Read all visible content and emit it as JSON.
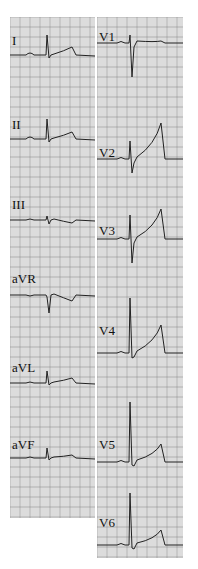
{
  "ecg": {
    "grid": {
      "minor_color": "#bdbdbd",
      "major_color": "#8f8f8f",
      "bg": "#eeeeee",
      "trace_color": "#222222"
    },
    "left_panel": {
      "x": 10,
      "y": 17,
      "w": 85,
      "h": 501,
      "leads": [
        {
          "label": "I",
          "label_x": 2,
          "label_y": 28,
          "baseline": 38,
          "beat_x": 36,
          "p": 2,
          "r": -20,
          "q": 0,
          "s": 3,
          "t": -8,
          "t_x": 62
        },
        {
          "label": "II",
          "label_x": 2,
          "label_y": 112,
          "baseline": 122,
          "beat_x": 36,
          "p": 2,
          "r": -20,
          "q": 0,
          "s": 3,
          "t": -7,
          "t_x": 62
        },
        {
          "label": "III",
          "label_x": 2,
          "label_y": 192,
          "baseline": 203,
          "beat_x": 36,
          "p": 1,
          "r": -4,
          "q": 0,
          "s": 4,
          "t": 3,
          "t_x": 62
        },
        {
          "label": "aVR",
          "label_x": 2,
          "label_y": 266,
          "baseline": 278,
          "beat_x": 36,
          "p": -1,
          "r": 2,
          "q": 0,
          "s": 18,
          "t": 6,
          "t_x": 62
        },
        {
          "label": "aVL",
          "label_x": 2,
          "label_y": 355,
          "baseline": 366,
          "beat_x": 36,
          "p": 1,
          "r": -12,
          "q": 0,
          "s": 2,
          "t": -5,
          "t_x": 62
        },
        {
          "label": "aVF",
          "label_x": 2,
          "label_y": 432,
          "baseline": 441,
          "beat_x": 36,
          "p": 1,
          "r": -10,
          "q": 0,
          "s": 2,
          "t": -3,
          "t_x": 62
        }
      ]
    },
    "right_panel": {
      "x": 97,
      "y": 17,
      "w": 86,
      "h": 541,
      "leads": [
        {
          "label": "V1",
          "label_x": 2,
          "label_y": 24,
          "baseline": 26,
          "beat_x": 3,
          "p": 1,
          "r": -8,
          "q": 0,
          "s": 34,
          "t": -2,
          "t_x": 30
        },
        {
          "label": "V2",
          "label_x": 2,
          "label_y": 140,
          "baseline": 142,
          "beat_x": 3,
          "p": 1,
          "r": -18,
          "q": 0,
          "s": 14,
          "t": -36,
          "t_x": 30
        },
        {
          "label": "V3",
          "label_x": 2,
          "label_y": 218,
          "baseline": 222,
          "beat_x": 3,
          "p": 1,
          "r": -24,
          "q": 0,
          "s": 24,
          "t": -30,
          "t_x": 30
        },
        {
          "label": "V4",
          "label_x": 2,
          "label_y": 318,
          "baseline": 336,
          "beat_x": 3,
          "p": 1,
          "r": -55,
          "q": 0,
          "s": 5,
          "t": -28,
          "t_x": 30
        },
        {
          "label": "V5",
          "label_x": 2,
          "label_y": 432,
          "baseline": 445,
          "beat_x": 3,
          "p": 1,
          "r": -60,
          "q": 0,
          "s": 3,
          "t": -18,
          "t_x": 30
        },
        {
          "label": "V6",
          "label_x": 2,
          "label_y": 510,
          "baseline": 528,
          "beat_x": 3,
          "p": 1,
          "r": -52,
          "q": 0,
          "s": 3,
          "t": -15,
          "t_x": 30
        }
      ]
    }
  }
}
